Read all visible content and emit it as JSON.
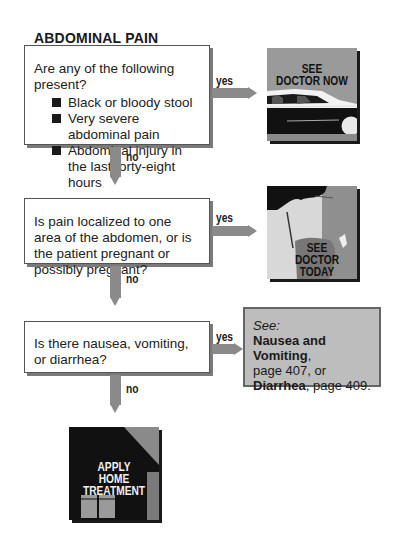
{
  "title": "ABDOMINAL PAIN",
  "colors": {
    "arrow": "#8a8a8a",
    "see_box_bg": "#bdbdbd",
    "image_bg": "#9a9a9a",
    "dark": "#1a1a1a"
  },
  "steps": [
    {
      "question": "Are any of the following present?",
      "bullets": [
        "Black or bloody stool",
        "Very severe abdominal pain",
        "Abdominal injury in the last forty-eight hours"
      ],
      "yes_label": "yes",
      "no_label": "no",
      "yes_result": {
        "type": "image",
        "icon": "car-icon",
        "line1": "SEE",
        "line2": "DOCTOR NOW"
      }
    },
    {
      "question": "Is pain localized to one area of the abdomen, or is the patient pregnant or possibly pregnant?",
      "yes_label": "yes",
      "no_label": "no",
      "yes_result": {
        "type": "image",
        "icon": "doctor-patient-icon",
        "line1": "SEE",
        "line2": "DOCTOR",
        "line3": "TODAY"
      }
    },
    {
      "question": "Is there nausea, vomiting, or diarrhea?",
      "yes_label": "yes",
      "no_label": "no",
      "yes_result": {
        "type": "reference",
        "see": "See:",
        "ref1_title": "Nausea and Vomiting",
        "ref1_suffix": ",",
        "ref1_page": "page 407, or",
        "ref2_title": "Diarrhea",
        "ref2_page": ", page 409."
      }
    }
  ],
  "final": {
    "icon": "house-icon",
    "line1": "APPLY",
    "line2": "HOME",
    "line3": "TREATMENT"
  }
}
